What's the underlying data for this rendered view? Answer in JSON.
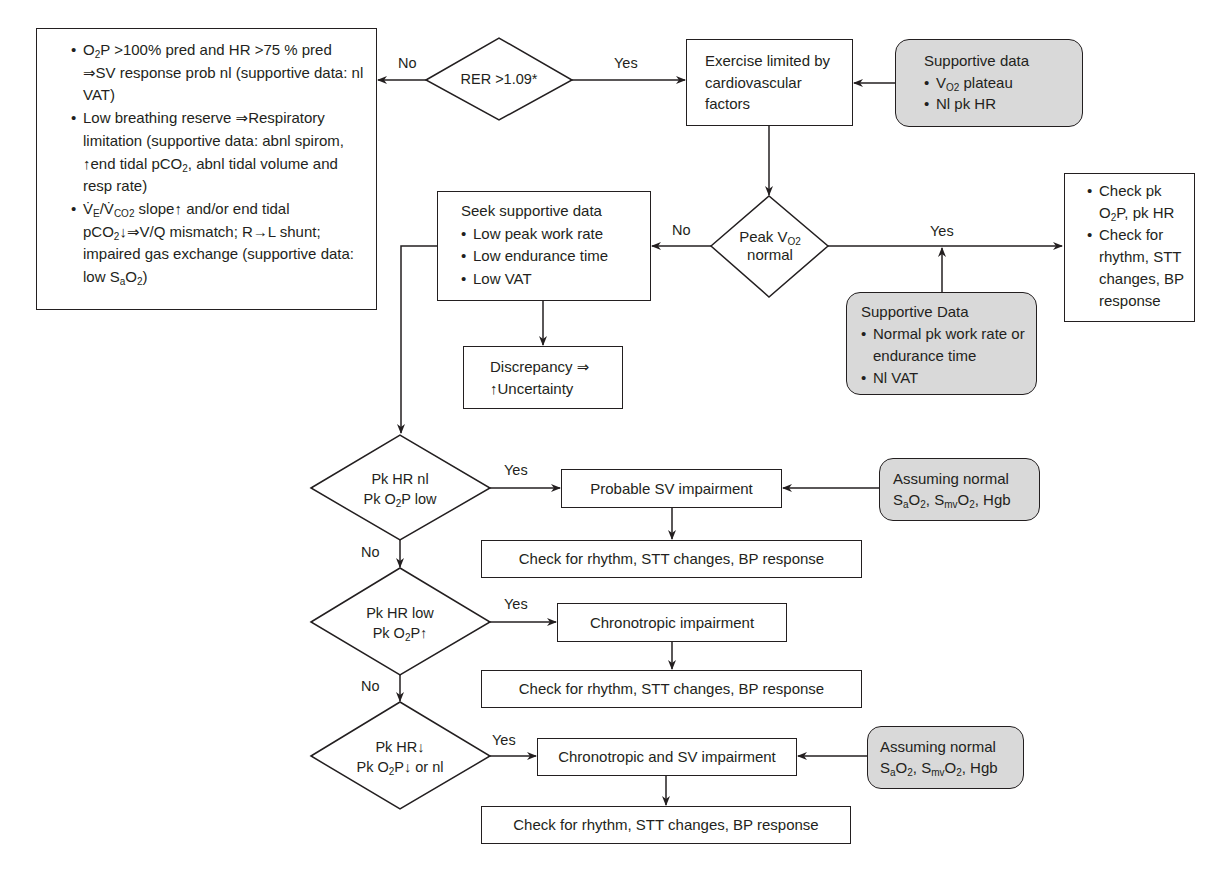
{
  "diagram": {
    "type": "flowchart",
    "colors": {
      "line": "#231f20",
      "supportive_fill": "#d9d9d9",
      "box_fill": "#ffffff"
    },
    "nodes": {
      "rer_decision": {
        "label": "RER >1.09*"
      },
      "exercise_limited": {
        "label": "Exercise limited by cardiovascular factors"
      },
      "supportive_top": {
        "title": "Supportive data",
        "items": [
          "V",
          "Nl pk HR"
        ],
        "item1_sub": "O2",
        "item1_rest": " plateau"
      },
      "non_cardiac": {
        "items": [
          {
            "a": "O",
            "a_sub": "2",
            "b": "P >100% pred and HR >75 % pred ⇒SV response prob nl (supportive data: nl VAT)"
          },
          {
            "a": "Low breathing reserve ⇒Respiratory limitation (supportive data: abnl spirom, ↑end tidal pCO",
            "a_sub": "2",
            "b": ", abnl tidal volume and resp rate)"
          },
          {
            "a": "V̇",
            "a_sub": "E",
            "b": "/V̇",
            "b_sub": "CO2",
            "c": " slope↑ and/or end tidal pCO",
            "c_sub": "2",
            "d": "↓⇒V/Q mismatch; R→L shunt; impaired gas exchange (supportive data: low S",
            "d_sub": "a",
            "e": "O",
            "e_sub": "2",
            "f": ")"
          }
        ]
      },
      "peak_vo2_decision": {
        "line1": "Peak V",
        "line1_sub": "O2",
        "line2": "normal"
      },
      "seek_supportive": {
        "title": "Seek supportive data",
        "items": [
          "Low peak work rate",
          "Low endurance time",
          "Low VAT"
        ]
      },
      "discrepancy": {
        "line1": "Discrepancy ⇒",
        "line2": "↑Uncertainty"
      },
      "check_pk": {
        "item1_a": "Check pk O",
        "item1_sub": "2",
        "item1_b": "P, pk HR",
        "item2": "Check for rhythm, STT changes, BP response"
      },
      "supportive_lower": {
        "title": "Supportive Data",
        "items": [
          "Normal pk work rate or endurance time",
          "Nl VAT"
        ]
      },
      "decision_1": {
        "line1": "Pk HR nl",
        "line2_a": "Pk O",
        "line2_sub": "2",
        "line2_b": "P low"
      },
      "result_1": {
        "label": "Probable SV impairment"
      },
      "check_1": {
        "label": "Check for rhythm, STT changes, BP response"
      },
      "assuming_1": {
        "line1": "Assuming normal",
        "s": "S",
        "s_sub": "a",
        "o": "O",
        "o_sub": "2",
        "comma": ", ",
        "s2": "S",
        "s2_sub": "mv",
        "o2": "O",
        "o2_sub": "2",
        "tail": ", Hgb"
      },
      "decision_2": {
        "line1": "Pk HR low",
        "line2_a": "Pk O",
        "line2_sub": "2",
        "line2_b": "P↑"
      },
      "result_2": {
        "label": "Chronotropic impairment"
      },
      "check_2": {
        "label": "Check for rhythm, STT changes, BP response"
      },
      "decision_3": {
        "line1": "Pk HR↓",
        "line2_a": "Pk O",
        "line2_sub": "2",
        "line2_b": "P↓ or nl"
      },
      "result_3": {
        "label": "Chronotropic and SV impairment"
      },
      "check_3": {
        "label": "Check for rhythm, STT changes, BP response"
      },
      "assuming_2": {
        "line1": "Assuming normal",
        "s": "S",
        "s_sub": "a",
        "o": "O",
        "o_sub": "2",
        "comma": ", ",
        "s2": "S",
        "s2_sub": "mv",
        "o2": "O",
        "o2_sub": "2",
        "tail": ", Hgb"
      }
    },
    "edge_labels": {
      "rer_no": "No",
      "rer_yes": "Yes",
      "peak_no": "No",
      "peak_yes": "Yes",
      "d1_yes": "Yes",
      "d1_no": "No",
      "d2_yes": "Yes",
      "d2_no": "No",
      "d3_yes": "Yes"
    }
  }
}
